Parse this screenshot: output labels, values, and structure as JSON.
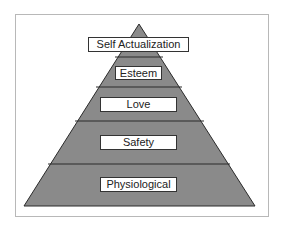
{
  "diagram": {
    "levels": [
      {
        "label": "Self Actualization"
      },
      {
        "label": "Esteem"
      },
      {
        "label": "Love"
      },
      {
        "label": "Safety"
      },
      {
        "label": "Physiological"
      }
    ],
    "colors": {
      "fill": "#8a8a8a",
      "line": "#2a2a2a",
      "label_bg": "#ffffff"
    }
  }
}
